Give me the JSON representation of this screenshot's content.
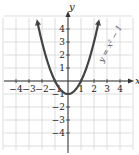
{
  "chart_data": {
    "type": "line",
    "title": "",
    "xlabel": "x",
    "ylabel": "y",
    "xlim": [
      -5,
      5
    ],
    "ylim": [
      -5,
      5
    ],
    "grid": true,
    "x_ticks": [
      -4,
      -3,
      -2,
      -1,
      1,
      2,
      3,
      4
    ],
    "y_ticks": [
      -4,
      -3,
      -2,
      -1,
      1,
      2,
      3,
      4
    ],
    "x_tick_labels": [
      "−4",
      "−3",
      "−2",
      "−1",
      "1",
      "2",
      "3",
      "4"
    ],
    "y_tick_labels": [
      "−4",
      "−3",
      "−2",
      "−1",
      "1",
      "2",
      "3",
      "4"
    ],
    "series": [
      {
        "name": "y = x² − 1",
        "equation": "y = x^2 - 1",
        "color": "#444444",
        "x": [
          -2.4,
          -2,
          -1.5,
          -1,
          -0.5,
          0,
          0.5,
          1,
          1.5,
          2,
          2.4
        ],
        "y": [
          4.76,
          3,
          1.25,
          0,
          -0.75,
          -1,
          -0.75,
          0,
          1.25,
          3,
          4.76
        ],
        "arrows_at_ends": true
      }
    ],
    "annotations": [
      {
        "text": "y = x² − 1",
        "position": "right of curve, rotated along curve",
        "near": [
          2.5,
          2
        ]
      }
    ],
    "vertex": [
      0,
      -1
    ],
    "x_intercepts": [
      -1,
      1
    ]
  },
  "labels": {
    "x_axis": "x",
    "y_axis": "y",
    "equation": "y = x² − 1"
  }
}
